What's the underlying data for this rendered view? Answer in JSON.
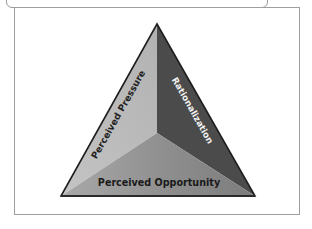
{
  "diagram": {
    "type": "fraud-triangle",
    "faces": [
      {
        "id": "left",
        "label": "Perceived Pressure",
        "color": "#b9b9b9",
        "text_color": "#222222"
      },
      {
        "id": "right",
        "label": "Rationalization",
        "color": "#4a4a4a",
        "text_color": "#f2f2f2"
      },
      {
        "id": "bottom",
        "label": "Perceived Opportunity",
        "color": "#8c8c8c",
        "text_color": "#1a1a1a"
      }
    ],
    "colors": {
      "outline": "#1e1e1e",
      "frame": "#9e9e9e",
      "bottom_gradient_light": "#a8a8a8",
      "bottom_gradient_dark": "#7a7a7a"
    }
  }
}
